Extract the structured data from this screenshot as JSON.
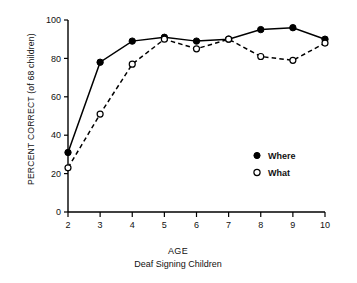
{
  "chart_data": {
    "type": "line",
    "title": "",
    "xlabel": "AGE",
    "sublabel": "Deaf Signing Children",
    "ylabel": "PERCENT CORRECT (of 68 children)",
    "x": [
      2,
      3,
      4,
      5,
      6,
      7,
      8,
      9,
      10
    ],
    "xtick_labels": [
      "2",
      "3",
      "4",
      "5",
      "6",
      "7",
      "8",
      "9",
      "10"
    ],
    "ytick_labels": [
      "0",
      "20",
      "40",
      "60",
      "80",
      "100"
    ],
    "yticks": [
      0,
      20,
      40,
      60,
      80,
      100
    ],
    "xlim": [
      2,
      10
    ],
    "ylim": [
      0,
      100
    ],
    "grid": false,
    "legend_position": "right-middle",
    "series": [
      {
        "name": "Where",
        "marker": "filled-circle",
        "linestyle": "solid",
        "color": "#000000",
        "values": [
          31,
          78,
          89,
          91,
          89,
          90,
          95,
          96,
          90
        ]
      },
      {
        "name": "What",
        "marker": "open-circle",
        "linestyle": "dashed",
        "color": "#000000",
        "values": [
          23,
          51,
          77,
          90,
          85,
          90,
          81,
          79,
          88
        ]
      }
    ]
  },
  "legend": {
    "entries": [
      {
        "label": "Where",
        "marker": "filled-circle"
      },
      {
        "label": "What",
        "marker": "open-circle"
      }
    ]
  },
  "colors": {
    "ink": "#000000",
    "background": "#ffffff"
  }
}
